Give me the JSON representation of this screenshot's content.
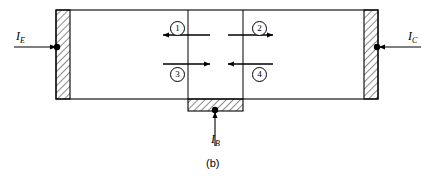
{
  "figure": {
    "caption": "(b)",
    "type": "bjt-cross-section-current-components"
  },
  "terminals": [
    {
      "id": "emitter",
      "symbol": "I",
      "subscript": "E",
      "arrow_direction": "right",
      "side": "left"
    },
    {
      "id": "collector",
      "symbol": "I",
      "subscript": "C",
      "arrow_direction": "left",
      "side": "right"
    },
    {
      "id": "base",
      "symbol": "I",
      "subscript": "B",
      "arrow_direction": "up",
      "side": "bottom"
    }
  ],
  "current_components": [
    {
      "number": "1",
      "glyph": "①",
      "arrow_direction": "left",
      "label_position": "above",
      "region": "emitter-base-junction"
    },
    {
      "number": "2",
      "glyph": "②",
      "arrow_direction": "right",
      "label_position": "above",
      "region": "base-collector-junction"
    },
    {
      "number": "3",
      "glyph": "③",
      "arrow_direction": "right",
      "label_position": "below",
      "region": "emitter-base-junction"
    },
    {
      "number": "4",
      "glyph": "④",
      "arrow_direction": "left",
      "label_position": "below",
      "region": "base-collector-junction"
    }
  ],
  "regions": [
    {
      "id": "emitter-contact",
      "fill": "hatched",
      "orientation": "vertical"
    },
    {
      "id": "emitter-region",
      "fill": "none"
    },
    {
      "id": "base-region",
      "fill": "none"
    },
    {
      "id": "collector-region",
      "fill": "none"
    },
    {
      "id": "collector-contact",
      "fill": "hatched",
      "orientation": "vertical"
    },
    {
      "id": "base-contact",
      "fill": "hatched",
      "orientation": "horizontal"
    }
  ],
  "colors": {
    "line": "#000000",
    "background": "#ffffff",
    "hatch": "#000000"
  }
}
